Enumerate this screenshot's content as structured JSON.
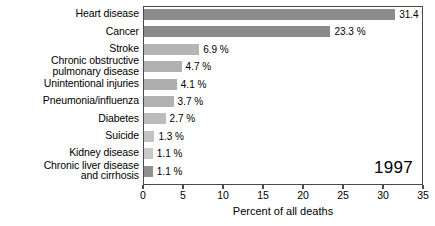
{
  "chart_data": {
    "type": "bar",
    "orientation": "horizontal",
    "title": "",
    "xlabel": "Percent of all deaths",
    "ylabel": "",
    "xlim": [
      0,
      35
    ],
    "xticks": [
      0,
      5,
      10,
      15,
      20,
      25,
      30,
      35
    ],
    "xtick_labels": [
      "0",
      "5",
      "10",
      "15",
      "20",
      "25",
      "30",
      "35"
    ],
    "grid": false,
    "legend": null,
    "annotation": "1997",
    "value_suffix": "%",
    "categories": [
      "Heart disease",
      "Cancer",
      "Stroke",
      "Chronic obstructive\npulmonary disease",
      "Unintentional injuries",
      "Pneumonia/influenza",
      "Diabetes",
      "Suicide",
      "Kidney disease",
      "Chronic liver disease\nand cirrhosis"
    ],
    "values": [
      31.4,
      23.3,
      6.9,
      4.7,
      4.1,
      3.7,
      2.7,
      1.3,
      1.1,
      1.1
    ],
    "value_labels": [
      "31.4 %",
      "23.3 %",
      "6.9 %",
      "4.7 %",
      "4.1 %",
      "3.7 %",
      "2.7 %",
      "1.3 %",
      "1.1 %",
      "1.1 %"
    ],
    "bar_colors": [
      "#8c8c8c",
      "#8a8a8a",
      "#b5b5b5",
      "#b0b0b0",
      "#adadad",
      "#b2b2b2",
      "#bcbcbc",
      "#c2c2c2",
      "#c9c9c9",
      "#8f8f8f"
    ]
  },
  "style": {
    "background": "#ffffff",
    "frame_color": "#4a4a4a",
    "text_color": "#000000"
  }
}
